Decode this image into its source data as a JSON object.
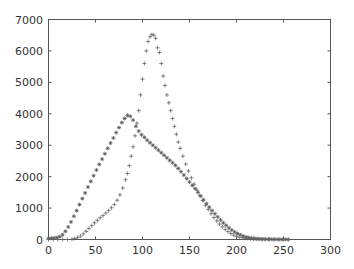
{
  "chart_data": {
    "type": "scatter",
    "title": "",
    "xlabel": "",
    "ylabel": "",
    "xlim": [
      0,
      300
    ],
    "ylim": [
      0,
      7000
    ],
    "grid": false,
    "legend": null,
    "x_ticks": [
      0,
      50,
      100,
      150,
      200,
      250,
      300
    ],
    "y_ticks": [
      0,
      1000,
      2000,
      3000,
      4000,
      5000,
      6000,
      7000
    ],
    "series": [
      {
        "name": "series-star",
        "marker": "*",
        "color": "#555555",
        "x": [
          0,
          3,
          6,
          9,
          12,
          15,
          18,
          21,
          24,
          27,
          30,
          33,
          36,
          39,
          42,
          45,
          48,
          51,
          54,
          57,
          60,
          63,
          66,
          69,
          72,
          75,
          78,
          81,
          84,
          87,
          90,
          93,
          96,
          99,
          102,
          105,
          108,
          111,
          114,
          117,
          120,
          123,
          126,
          129,
          132,
          135,
          138,
          141,
          144,
          147,
          150,
          153,
          156,
          159,
          162,
          165,
          168,
          171,
          174,
          177,
          180,
          183,
          186,
          189,
          192,
          195,
          198,
          201,
          204,
          207,
          210,
          213,
          216,
          219,
          222,
          225,
          228,
          231,
          234,
          237,
          240,
          243,
          246,
          249,
          252,
          255
        ],
        "y": [
          30,
          40,
          50,
          60,
          90,
          150,
          260,
          400,
          560,
          740,
          920,
          1110,
          1300,
          1480,
          1670,
          1850,
          2030,
          2210,
          2390,
          2560,
          2730,
          2900,
          3070,
          3230,
          3400,
          3560,
          3720,
          3850,
          3950,
          3920,
          3800,
          3600,
          3450,
          3330,
          3250,
          3160,
          3080,
          3000,
          2920,
          2840,
          2760,
          2680,
          2600,
          2520,
          2440,
          2360,
          2260,
          2160,
          2050,
          1940,
          1830,
          1720,
          1620,
          1500,
          1380,
          1260,
          1140,
          1030,
          920,
          820,
          720,
          620,
          530,
          450,
          370,
          300,
          240,
          190,
          150,
          110,
          80,
          60,
          45,
          35,
          25,
          20,
          15,
          12,
          10,
          8,
          6,
          5,
          4,
          3,
          2,
          2
        ]
      },
      {
        "name": "series-plus",
        "marker": "+",
        "color": "#666666",
        "x": [
          0,
          5,
          10,
          15,
          20,
          25,
          28,
          31,
          34,
          37,
          40,
          43,
          46,
          49,
          52,
          55,
          58,
          61,
          64,
          67,
          70,
          73,
          76,
          79,
          82,
          84,
          86,
          88,
          90,
          92,
          94,
          96,
          98,
          100,
          102,
          104,
          106,
          108,
          110,
          112,
          114,
          116,
          118,
          120,
          122,
          124,
          126,
          128,
          130,
          132,
          134,
          136,
          138,
          140,
          143,
          146,
          149,
          152,
          155,
          158,
          161,
          164,
          167,
          170,
          173,
          176,
          179,
          182,
          185,
          188,
          191,
          194,
          197,
          200,
          203,
          206,
          209,
          212,
          215,
          218,
          221,
          224,
          227,
          230,
          235,
          240,
          245,
          250,
          255
        ],
        "y": [
          0,
          0,
          0,
          0,
          0,
          10,
          30,
          60,
          110,
          180,
          260,
          350,
          440,
          530,
          610,
          690,
          760,
          840,
          920,
          1010,
          1110,
          1250,
          1420,
          1640,
          1900,
          2100,
          2350,
          2650,
          2950,
          3300,
          3700,
          4100,
          4600,
          5100,
          5600,
          6000,
          6300,
          6450,
          6520,
          6500,
          6400,
          6100,
          5950,
          5600,
          5200,
          4900,
          4600,
          4350,
          4100,
          3850,
          3600,
          3350,
          3100,
          2900,
          2650,
          2400,
          2180,
          1960,
          1760,
          1570,
          1400,
          1240,
          1090,
          950,
          820,
          700,
          590,
          490,
          400,
          320,
          250,
          190,
          140,
          100,
          75,
          55,
          40,
          30,
          20,
          14,
          10,
          7,
          5,
          3,
          2,
          1,
          0,
          0,
          0
        ]
      }
    ]
  },
  "axes": {
    "x_tick_labels": [
      "0",
      "50",
      "100",
      "150",
      "200",
      "250",
      "300"
    ],
    "y_tick_labels": [
      "0",
      "1000",
      "2000",
      "3000",
      "4000",
      "5000",
      "6000",
      "7000"
    ]
  }
}
